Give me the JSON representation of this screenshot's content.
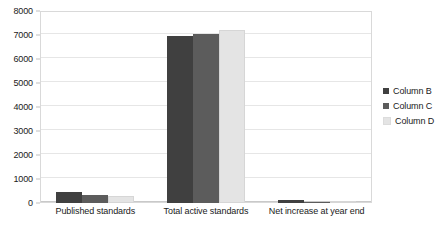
{
  "chart_data": {
    "type": "bar",
    "title": "",
    "subtitle": "",
    "xlabel": "",
    "ylabel": "",
    "ylim": [
      0,
      8000
    ],
    "ytick_labels": [
      "0",
      "1000",
      "2000",
      "3000",
      "4000",
      "5000",
      "6000",
      "7000",
      "8000"
    ],
    "yticks": [
      0,
      1000,
      2000,
      3000,
      4000,
      5000,
      6000,
      7000,
      8000
    ],
    "grid": true,
    "legend_position": "right",
    "categories": [
      "Published standards",
      "Total active standards",
      "Net increase at year end"
    ],
    "series": [
      {
        "name": "Column B",
        "color": "#404040",
        "values": [
          470,
          6970,
          120
        ]
      },
      {
        "name": "Column C",
        "color": "#5c5c5c",
        "values": [
          340,
          7030,
          40
        ]
      },
      {
        "name": "Column D",
        "color": "#e4e4e4",
        "values": [
          290,
          7220,
          30
        ]
      }
    ]
  },
  "style": {
    "background": "#ffffff",
    "plot_border": "#d9d9d9",
    "gridline": "#e6e6e6",
    "baseline": "#c9c9c9",
    "text": "#1a1a1a"
  }
}
